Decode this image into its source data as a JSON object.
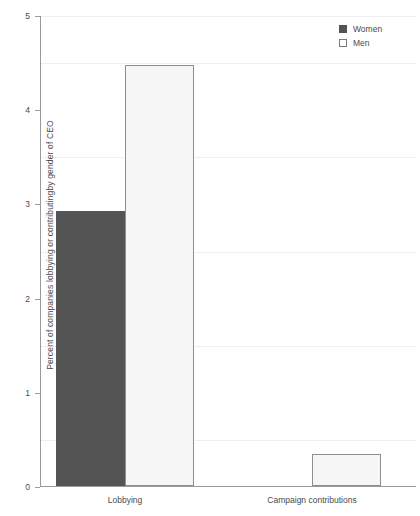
{
  "chart_data": {
    "type": "bar",
    "title": "",
    "subtitle": "",
    "xlabel": "",
    "ylabel": "Percent of companies lobbying or contributingby gender of CEO",
    "categories": [
      "Lobbying",
      "Campaign contributions"
    ],
    "series": [
      {
        "name": "Women",
        "color": "#545454",
        "values": [
          2.92,
          0.0
        ]
      },
      {
        "name": "Men",
        "color": "#f6f6f6",
        "values": [
          4.47,
          0.34
        ]
      }
    ],
    "ylim": [
      0,
      5
    ],
    "yticks": [
      0,
      1,
      2,
      3,
      4,
      5
    ],
    "ytick_labels": [
      "0",
      "1",
      "2",
      "3",
      "4",
      "5"
    ],
    "gridlines": [
      0.5,
      1.5,
      2.5,
      3.5,
      4.5
    ],
    "grid": true,
    "legend_position": "top-right",
    "legend": [
      {
        "label": "Women",
        "swatch": "filled-square"
      },
      {
        "label": "Men",
        "swatch": "open-square"
      }
    ]
  },
  "axis": {
    "tick_0": "0",
    "tick_1": "1",
    "tick_2": "2",
    "tick_3": "3",
    "tick_4": "4",
    "tick_5": "5"
  },
  "colors": {
    "women_fill": "#545454",
    "men_fill": "#f6f6f6",
    "men_edge": "#8e8e8e",
    "axis": "#9a9a9a",
    "grid": "#e2e2e2",
    "text": "#4a4a4a",
    "background": "#ffffff"
  }
}
